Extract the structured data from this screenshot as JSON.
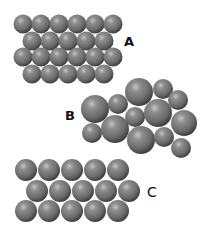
{
  "colors": {
    "background": "#ffffff",
    "sphere_highlight": "#b8b8b8",
    "sphere_mid": "#7a7a7a",
    "sphere_dark": "#3c3c3c",
    "label": "#111111"
  },
  "panels": [
    {
      "id": "A",
      "label": "A",
      "label_pos": [
        124,
        35
      ],
      "description": "Regular close-packed arrangement of equal-size spheres, 4 rows (6-5-6-5)",
      "spheres": [
        [
          23,
          24,
          9.5
        ],
        [
          41,
          24,
          9.5
        ],
        [
          59,
          24,
          9.5
        ],
        [
          77,
          24,
          9.5
        ],
        [
          95,
          24,
          9.5
        ],
        [
          113,
          24,
          9.5
        ],
        [
          32,
          41,
          9.5
        ],
        [
          50,
          41,
          9.5
        ],
        [
          68,
          41,
          9.5
        ],
        [
          86,
          41,
          9.5
        ],
        [
          104,
          41,
          9.5
        ],
        [
          23,
          57,
          9.5
        ],
        [
          41,
          57,
          9.5
        ],
        [
          59,
          57,
          9.5
        ],
        [
          77,
          57,
          9.5
        ],
        [
          95,
          57,
          9.5
        ],
        [
          113,
          57,
          9.5
        ],
        [
          32,
          74,
          9.5
        ],
        [
          50,
          74,
          9.5
        ],
        [
          68,
          74,
          9.5
        ],
        [
          86,
          74,
          9.5
        ],
        [
          104,
          74,
          9.5
        ]
      ]
    },
    {
      "id": "B",
      "label": "B",
      "label_pos": [
        65,
        109
      ],
      "description": "Irregular arrangement of spheres of differing sizes",
      "spheres": [
        [
          139,
          92,
          14
        ],
        [
          163,
          89,
          10
        ],
        [
          178,
          100,
          10
        ],
        [
          95,
          109,
          14
        ],
        [
          118,
          104,
          10
        ],
        [
          135,
          117,
          10
        ],
        [
          158,
          113,
          14
        ],
        [
          184,
          123,
          13
        ],
        [
          92,
          133,
          10
        ],
        [
          115,
          129,
          14
        ],
        [
          141,
          140,
          14
        ],
        [
          164,
          137,
          10
        ],
        [
          181,
          148,
          10
        ]
      ]
    },
    {
      "id": "C",
      "label": "C",
      "label_pos": [
        147,
        185
      ],
      "description": "Regular packing of equal-size spheres, 3 rows (5-5-5)",
      "spheres": [
        [
          26,
          170,
          11
        ],
        [
          49,
          170,
          11
        ],
        [
          72,
          170,
          11
        ],
        [
          95,
          170,
          11
        ],
        [
          118,
          170,
          11
        ],
        [
          37,
          191,
          11
        ],
        [
          60,
          191,
          11
        ],
        [
          83,
          191,
          11
        ],
        [
          106,
          191,
          11
        ],
        [
          129,
          191,
          11
        ],
        [
          26,
          211,
          11
        ],
        [
          49,
          211,
          11
        ],
        [
          72,
          211,
          11
        ],
        [
          95,
          211,
          11
        ],
        [
          118,
          211,
          11
        ]
      ]
    }
  ]
}
